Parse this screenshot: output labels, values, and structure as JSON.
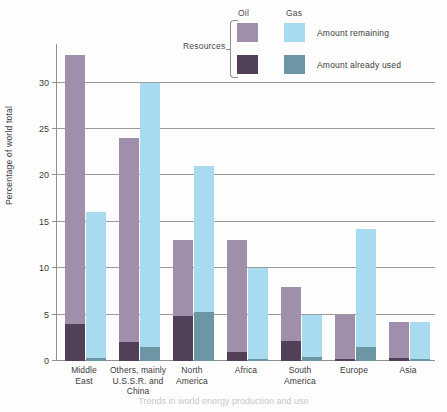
{
  "legend": {
    "resources_label": "Resources",
    "col_oil": "Oil",
    "col_gas": "Gas",
    "row_remaining": "Amount remaining",
    "row_used": "Amount already used"
  },
  "colors": {
    "oil_remaining": "#9f8fab",
    "oil_used": "#514057",
    "gas_remaining": "#a8daf0",
    "gas_used": "#6d96a5",
    "gridline": "#9a9a9a",
    "axis": "#8f8f8f",
    "text": "#3b3b3b"
  },
  "chart_data": {
    "type": "bar",
    "title": "",
    "xlabel": "",
    "ylabel": "Percentage of world total",
    "ylim": [
      0,
      33.5
    ],
    "yticks": [
      0,
      5,
      10,
      15,
      20,
      25,
      30
    ],
    "ytick_labels": [
      "0",
      "5",
      "10",
      "15",
      "20",
      "25",
      "30"
    ],
    "grid": true,
    "stacked": true,
    "legend_position": "top-right",
    "categories": [
      "Middle East",
      "Others, mainly U.S.S.R. and China",
      "North America",
      "Africa",
      "South America",
      "Europe",
      "Asia"
    ],
    "category_label_lines": [
      [
        "Middle",
        "East"
      ],
      [
        "Others, mainly",
        "U.S.S.R. and",
        "China"
      ],
      [
        "North",
        "America"
      ],
      [
        "Africa"
      ],
      [
        "South",
        "America"
      ],
      [
        "Europe"
      ],
      [
        "Asia"
      ]
    ],
    "series": [
      {
        "name": "Oil — total",
        "values": [
          33,
          24,
          13,
          13,
          8,
          5,
          4.2
        ]
      },
      {
        "name": "Oil — amount already used",
        "values": [
          4,
          2,
          4.8,
          1,
          2.2,
          0.2,
          0.3
        ]
      },
      {
        "name": "Gas — total",
        "values": [
          16,
          30,
          21,
          10,
          5,
          14.2,
          4.2
        ]
      },
      {
        "name": "Gas — amount already used",
        "values": [
          0.3,
          1.5,
          5.3,
          0.2,
          0.4,
          1.5,
          0.2
        ]
      }
    ]
  },
  "caption": "Trends in world energy production and use"
}
